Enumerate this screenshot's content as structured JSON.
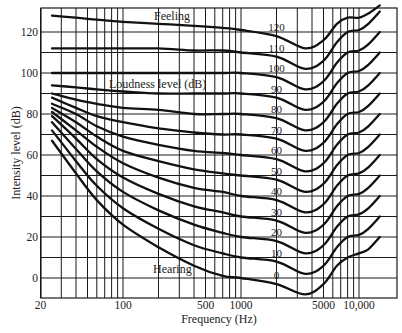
{
  "chart_data": {
    "type": "line",
    "title": "",
    "xlabel": "Frequency (Hz)",
    "ylabel": "Intensity level (dB)",
    "xscale": "log",
    "xlim": [
      20,
      20500
    ],
    "ylim": [
      -10,
      132
    ],
    "grid": true,
    "x_tick_labels": [
      {
        "value": 20,
        "label": "20"
      },
      {
        "value": 100,
        "label": "100"
      },
      {
        "value": 500,
        "label": "500"
      },
      {
        "value": 1000,
        "label": "1000"
      },
      {
        "value": 5000,
        "label": "5000"
      },
      {
        "value": 10000,
        "label": "10,000"
      }
    ],
    "x_gridlines": [
      20,
      30,
      40,
      50,
      60,
      70,
      80,
      90,
      100,
      200,
      300,
      400,
      500,
      600,
      700,
      800,
      900,
      1000,
      2000,
      3000,
      4000,
      5000,
      6000,
      7000,
      8000,
      9000,
      10000
    ],
    "y_tick_labels": [
      0,
      20,
      40,
      60,
      80,
      100,
      120
    ],
    "y_gridlines": [
      0,
      10,
      20,
      30,
      40,
      50,
      60,
      70,
      80,
      90,
      100,
      110,
      120
    ],
    "annotations": [
      {
        "text": "Feeling",
        "x": 180,
        "y": 127
      },
      {
        "text": "Loudness level (dB)",
        "x": 300,
        "y": 95
      },
      {
        "text": "Hearing",
        "x": 250,
        "y": 4
      }
    ],
    "series_label_positions": "phon labels placed near 2000 Hz on each curve",
    "series": [
      {
        "name": "0",
        "freq": [
          25,
          40,
          60,
          100,
          200,
          400,
          700,
          1000,
          2000,
          3500,
          5000,
          6500,
          8000,
          10000,
          12000,
          15000
        ],
        "db": [
          67,
          51,
          38,
          26,
          15,
          6,
          1,
          0,
          -3,
          -8,
          -3,
          6,
          10,
          12,
          14,
          20
        ]
      },
      {
        "name": "10",
        "freq": [
          25,
          40,
          60,
          100,
          200,
          400,
          700,
          1000,
          2000,
          3500,
          5000,
          6500,
          8000,
          10000,
          12000,
          15000
        ],
        "db": [
          72,
          57,
          45,
          34,
          24,
          16,
          12,
          10,
          8,
          2,
          6,
          15,
          20,
          21,
          24,
          30
        ]
      },
      {
        "name": "20",
        "freq": [
          25,
          40,
          60,
          100,
          200,
          400,
          700,
          1000,
          2000,
          3500,
          5000,
          6500,
          8000,
          10000,
          12000,
          15000
        ],
        "db": [
          76,
          63,
          52,
          42,
          33,
          26,
          22,
          20,
          18,
          12,
          16,
          25,
          30,
          31,
          34,
          40
        ]
      },
      {
        "name": "30",
        "freq": [
          25,
          40,
          60,
          100,
          200,
          400,
          700,
          1000,
          2000,
          3500,
          5000,
          6500,
          8000,
          10000,
          12000,
          15000
        ],
        "db": [
          79,
          68,
          58,
          49,
          41,
          35,
          32,
          30,
          28,
          22,
          26,
          35,
          40,
          41,
          44,
          50
        ]
      },
      {
        "name": "40",
        "freq": [
          25,
          40,
          60,
          100,
          200,
          400,
          700,
          1000,
          2000,
          3500,
          5000,
          6500,
          8000,
          10000,
          12000,
          15000
        ],
        "db": [
          81,
          72,
          64,
          56,
          49,
          44,
          42,
          40,
          38,
          32,
          36,
          45,
          50,
          51,
          54,
          60
        ]
      },
      {
        "name": "50",
        "freq": [
          25,
          40,
          60,
          100,
          200,
          400,
          700,
          1000,
          2000,
          3500,
          5000,
          6500,
          8000,
          10000,
          12000,
          15000
        ],
        "db": [
          83,
          76,
          69,
          62,
          57,
          53,
          51,
          50,
          48,
          42,
          46,
          55,
          60,
          61,
          64,
          70
        ]
      },
      {
        "name": "60",
        "freq": [
          25,
          40,
          60,
          100,
          200,
          400,
          700,
          1000,
          2000,
          3500,
          5000,
          6500,
          8000,
          10000,
          12000,
          15000
        ],
        "db": [
          85,
          80,
          74,
          69,
          65,
          62,
          61,
          60,
          58,
          52,
          56,
          65,
          70,
          71,
          74,
          80
        ]
      },
      {
        "name": "70",
        "freq": [
          25,
          40,
          60,
          100,
          200,
          400,
          700,
          1000,
          2000,
          3500,
          5000,
          6500,
          8000,
          10000,
          12000,
          15000
        ],
        "db": [
          88,
          83,
          79,
          76,
          73,
          71,
          70,
          70,
          68,
          62,
          66,
          75,
          80,
          81,
          84,
          90
        ]
      },
      {
        "name": "80",
        "freq": [
          25,
          40,
          60,
          100,
          200,
          400,
          700,
          1000,
          2000,
          3500,
          5000,
          6500,
          8000,
          10000,
          12000,
          15000
        ],
        "db": [
          90,
          87,
          85,
          83,
          82,
          80,
          80,
          80,
          78,
          72,
          76,
          85,
          90,
          91,
          94,
          100
        ]
      },
      {
        "name": "90",
        "freq": [
          25,
          40,
          60,
          100,
          200,
          400,
          700,
          1000,
          2000,
          3500,
          5000,
          6500,
          8000,
          10000,
          12000,
          15000
        ],
        "db": [
          94,
          93,
          92,
          91,
          90,
          90,
          90,
          90,
          88,
          82,
          86,
          95,
          100,
          101,
          104,
          110
        ]
      },
      {
        "name": "100",
        "freq": [
          25,
          40,
          60,
          100,
          200,
          400,
          700,
          1000,
          2000,
          3500,
          5000,
          6500,
          8000,
          10000,
          12000,
          15000
        ],
        "db": [
          100,
          100,
          100,
          100,
          100,
          100,
          100,
          100,
          98,
          92,
          96,
          105,
          110,
          111,
          114,
          120
        ]
      },
      {
        "name": "110",
        "freq": [
          25,
          40,
          60,
          100,
          200,
          400,
          700,
          1000,
          2000,
          3500,
          5000,
          6500,
          8000,
          10000,
          12000,
          15000
        ],
        "db": [
          112,
          112,
          112,
          112,
          112,
          111,
          111,
          110,
          108,
          102,
          106,
          115,
          120,
          121,
          124,
          130
        ]
      },
      {
        "name": "120",
        "freq": [
          25,
          40,
          60,
          100,
          200,
          400,
          700,
          1000,
          2000,
          3500,
          5000,
          6500,
          8000,
          10000,
          12000,
          15000
        ],
        "db": [
          128,
          127,
          126,
          125,
          124,
          123,
          122,
          121,
          118,
          112,
          116,
          124,
          127,
          127,
          129,
          133
        ]
      }
    ]
  },
  "labels": {
    "x_axis": "Frequency (Hz)",
    "y_axis": "Intensity level (dB)",
    "feeling": "Feeling",
    "loudness": "Loudness level (dB)",
    "hearing": "Hearing"
  }
}
